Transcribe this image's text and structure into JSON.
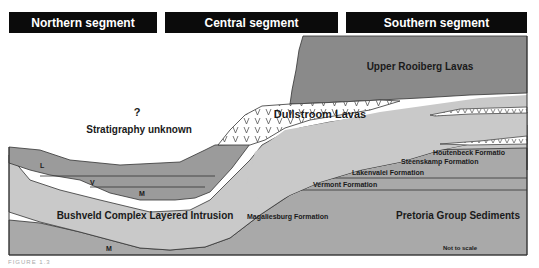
{
  "headers": {
    "northern": "Northern segment",
    "central": "Central segment",
    "southern": "Southern segment"
  },
  "labels": {
    "question": "?",
    "stratigraphy_unknown": "Stratigraphy unknown",
    "upper_rooiberg": "Upper Rooiberg Lavas",
    "dullstroom": "Dullstroom Lavas",
    "houtenbeck": "Houtenbeck Formatio",
    "steenskamp": "Steenskamp Formation",
    "lakenvalei": "Lakenvalei Formation",
    "vermont": "Vermont Formation",
    "magaliesburg": "Magaliesburg Formation",
    "bushveld": "Bushveld Complex Layered Intrusion",
    "pretoria": "Pretoria Group Sediments",
    "not_to_scale": "Not to scale",
    "zone_l": "L",
    "zone_v": "V",
    "zone_m_upper": "M",
    "zone_m_lower": "M"
  },
  "caption": "FIGURE 1.3",
  "colors": {
    "header_bg": "#0b0b0b",
    "upper_rooiberg": "#8c8c8c",
    "dullstroom": "#ffffff",
    "bushveld": "#c8c8c8",
    "pretoria": "#a8a8a8",
    "rustenburg_layers": "#9a9a9a",
    "outline": "#333333"
  }
}
